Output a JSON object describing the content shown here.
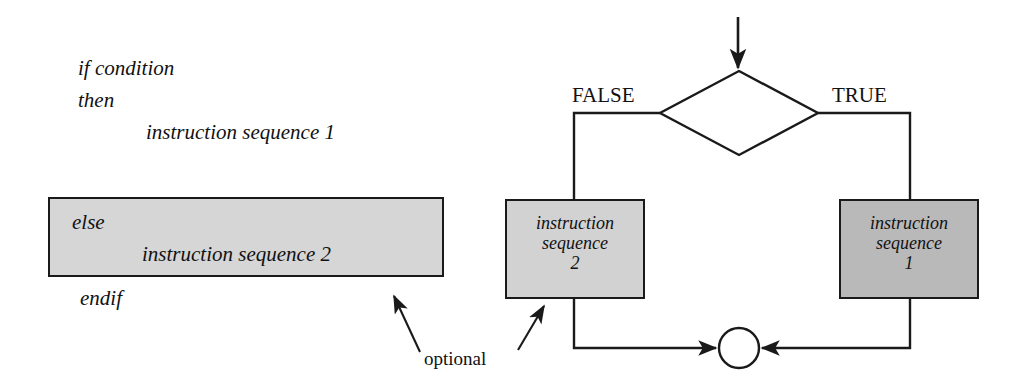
{
  "figure": {
    "kind": "if-then-else control structure",
    "background_color": "#ffffff",
    "line_color": "#1a1a1a"
  },
  "pseudocode": {
    "shaded_block_color": "#d6d6d6",
    "lines": [
      {
        "id": "if",
        "text": "if condition"
      },
      {
        "id": "then",
        "text": "then"
      },
      {
        "id": "seq1",
        "text": "instruction sequence 1"
      },
      {
        "id": "else",
        "text": "else"
      },
      {
        "id": "seq2",
        "text": "instruction sequence 2"
      },
      {
        "id": "endif",
        "text": "endif"
      }
    ]
  },
  "annotation": {
    "optional_label": "optional"
  },
  "flowchart": {
    "decision": {
      "label": "condition",
      "branch_false_label": "FALSE",
      "branch_true_label": "TRUE"
    },
    "process_false": {
      "line1": "instruction",
      "line2": "sequence",
      "line3": "2",
      "fill_color": "#d2d2d2"
    },
    "process_true": {
      "line1": "instruction",
      "line2": "sequence",
      "line3": "1",
      "fill_color": "#b9b9b9"
    },
    "merge_node": {
      "shape": "circle",
      "fill_color": "#ffffff"
    }
  }
}
